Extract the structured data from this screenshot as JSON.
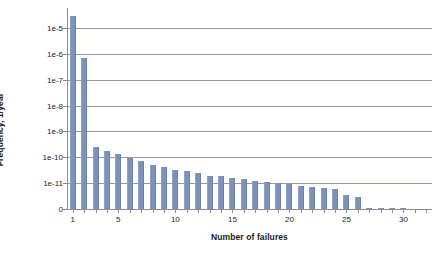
{
  "chart_data": {
    "type": "bar",
    "title": "",
    "xlabel": "Number of failures",
    "ylabel": "Frequency, 1/year",
    "yscale": "log-with-zero-baseline",
    "grid": true,
    "legend": null,
    "xlim": [
      0,
      32
    ],
    "ylim": [
      "0",
      "1e-5"
    ],
    "ytick_labels": [
      "1e-5",
      "1e-6",
      "1e-7",
      "1e-8",
      "1e-9",
      "1e-10",
      "1e-11",
      "0"
    ],
    "ytick_values": [
      1e-05,
      1e-06,
      1e-07,
      1e-08,
      1e-09,
      1e-10,
      1e-11,
      0
    ],
    "xtick_labels": [
      "1",
      "5",
      "10",
      "15",
      "20",
      "25",
      "30"
    ],
    "xtick_values": [
      1,
      5,
      10,
      15,
      20,
      25,
      30
    ],
    "categories": [
      1,
      2,
      3,
      4,
      5,
      6,
      7,
      8,
      9,
      10,
      11,
      12,
      13,
      14,
      15,
      16,
      17,
      18,
      19,
      20,
      21,
      22,
      23,
      24,
      25,
      26,
      27,
      28,
      29,
      30
    ],
    "values": [
      3e-05,
      7e-07,
      2.6e-10,
      1.75e-10,
      1.3e-10,
      9.7e-11,
      7.3e-11,
      5e-11,
      4.1e-11,
      3.2e-11,
      2.9e-11,
      2.4e-11,
      1.95e-11,
      1.85e-11,
      1.6e-11,
      1.5e-11,
      1.2e-11,
      1.1e-11,
      9.9e-12,
      9.1e-12,
      7.9e-12,
      7.4e-12,
      6.4e-12,
      6.1e-12,
      3.4e-12,
      3e-12,
      9e-13,
      8.5e-13,
      8e-13,
      8e-13
    ],
    "series_name": "Frequency",
    "bar_color": "#7B92BD",
    "gridline_color": "#9A9A8E",
    "axis_color": "#8C8C8C",
    "background_color": "#FFFFFF"
  }
}
